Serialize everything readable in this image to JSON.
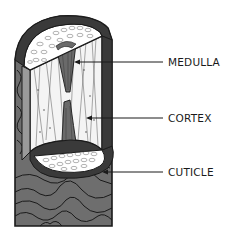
{
  "diagram": {
    "labels": [
      {
        "id": "medulla",
        "text": "MEDULLA"
      },
      {
        "id": "cortex",
        "text": "CORTEX"
      },
      {
        "id": "cuticle",
        "text": "CUTICLE"
      }
    ],
    "colors": {
      "cuticle_fill": "#6e6e6e",
      "outline": "#1a1a1a",
      "cortex_fill": "#f4f4f4",
      "medulla_fill": "#6a6a6a",
      "cells_fill": "#ffffff",
      "text": "#1a1a1a"
    }
  }
}
